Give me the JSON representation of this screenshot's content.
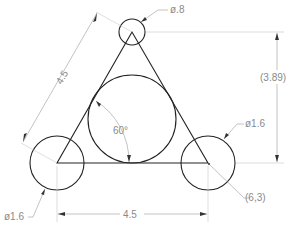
{
  "drawing": {
    "colors": {
      "geometry": "#222222",
      "dimension": "#9a9a9a",
      "text": "#8a8a8a",
      "background": "#ffffff"
    },
    "labels": {
      "top_circle_dia": "ø.8",
      "left_circle_dia": "ø1.6",
      "right_circle_dia": "ø1.6",
      "slanted_length": "4.5",
      "base_length": "4.5",
      "height_ref": "(3.89)",
      "angle": "60°",
      "coordinate": "(6,3)"
    },
    "entities": {
      "triangle": {
        "type": "equilateral",
        "side": 4.5
      },
      "circles": [
        {
          "name": "top",
          "diameter": 0.8
        },
        {
          "name": "bottom-left",
          "diameter": 1.6
        },
        {
          "name": "bottom-right",
          "diameter": 1.6,
          "center": "(6,3)"
        },
        {
          "name": "inscribed"
        }
      ]
    }
  }
}
